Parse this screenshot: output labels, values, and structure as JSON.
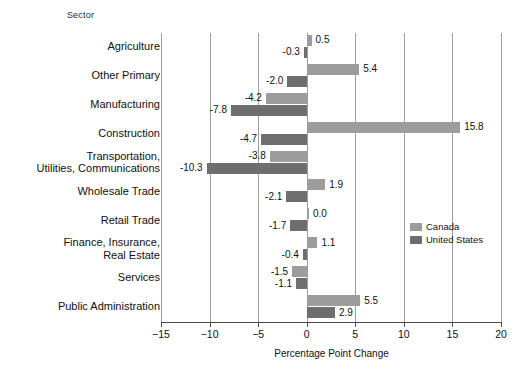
{
  "header": {
    "sector_title": "Sector"
  },
  "legend": {
    "position": "inside-right",
    "items": [
      {
        "label": "Canada",
        "color": "#9c9c9c",
        "key": "canada"
      },
      {
        "label": "United States",
        "color": "#6e6e6e",
        "key": "united_states"
      }
    ]
  },
  "axis": {
    "xlabel": "Percentage Point Change",
    "ticks": [
      "−15",
      "−10",
      "−5",
      "0",
      "5",
      "10",
      "15",
      "20"
    ],
    "tick_values": [
      -15,
      -10,
      -5,
      0,
      5,
      10,
      15,
      20
    ],
    "xlim": [
      -15,
      20
    ]
  },
  "chart_data": {
    "type": "bar",
    "orientation": "horizontal",
    "title": "",
    "subtitle": "",
    "xlabel": "Percentage Point Change",
    "ylabel": "Sector",
    "xlim": [
      -15,
      20
    ],
    "grid": true,
    "grid_axis": "x",
    "legend_position": "inside-right",
    "categories": [
      "Agriculture",
      "Other Primary",
      "Manufacturing",
      "Construction",
      "Transportation,\nUtilities, Communications",
      "Wholesale Trade",
      "Retail Trade",
      "Finance, Insurance,\nReal Estate",
      "Services",
      "Public Administration"
    ],
    "series": [
      {
        "name": "Canada",
        "color": "#9c9c9c",
        "values": [
          0.5,
          5.4,
          -4.2,
          15.8,
          -3.8,
          1.9,
          0.0,
          1.1,
          -1.5,
          5.5
        ],
        "labels": [
          "0.5",
          "5.4",
          "-4.2",
          "15.8",
          "-3.8",
          "1.9",
          "0.0",
          "1.1",
          "-1.5",
          "5.5"
        ]
      },
      {
        "name": "United States",
        "color": "#6e6e6e",
        "values": [
          -0.3,
          -2.0,
          -7.8,
          -4.7,
          -10.3,
          -2.1,
          -1.7,
          -0.4,
          -1.1,
          2.9
        ],
        "labels": [
          "-0.3",
          "-2.0",
          "-7.8",
          "-4.7",
          "-10.3",
          "-2.1",
          "-1.7",
          "-0.4",
          "-1.1",
          "2.9"
        ]
      }
    ]
  }
}
